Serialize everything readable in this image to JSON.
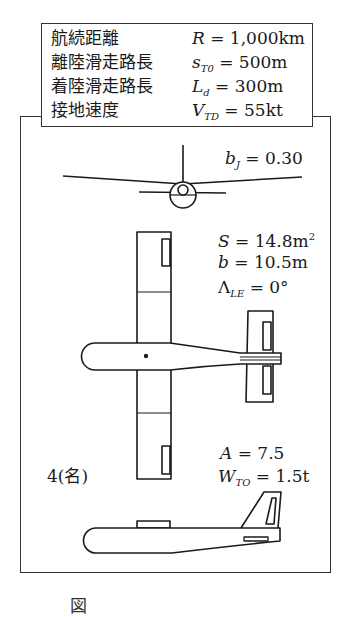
{
  "specs": [
    {
      "label": "航続距離",
      "symbol": "R",
      "sub": "",
      "eq": " = 1,000km"
    },
    {
      "label": "離陸滑走路長",
      "symbol": "s",
      "sub": "T0",
      "eq": " = 500m"
    },
    {
      "label": "着陸滑走路長",
      "symbol": "L",
      "sub": "d",
      "eq": " = 300m"
    },
    {
      "label": "接地速度",
      "symbol": "V",
      "sub": "TD",
      "eq": " = 55kt"
    }
  ],
  "annotations": {
    "bj": {
      "symbol": "b",
      "sub": "J",
      "eq": " = 0.30"
    },
    "S": {
      "symbol": "S",
      "eq": " = 14.8m",
      "sup": "2"
    },
    "b": {
      "symbol": "b",
      "eq": " = 10.5m"
    },
    "sweep": {
      "symbol": "Λ",
      "sub": "LE",
      "eq": " = 0°"
    },
    "A": {
      "symbol": "A",
      "eq": " = 7.5"
    },
    "wto": {
      "symbol": "W",
      "sub": "TO",
      "eq": " = 1.5t"
    },
    "seats": "4(名)"
  },
  "views": [
    "front-view",
    "top-view",
    "side-view"
  ],
  "caption": "図"
}
